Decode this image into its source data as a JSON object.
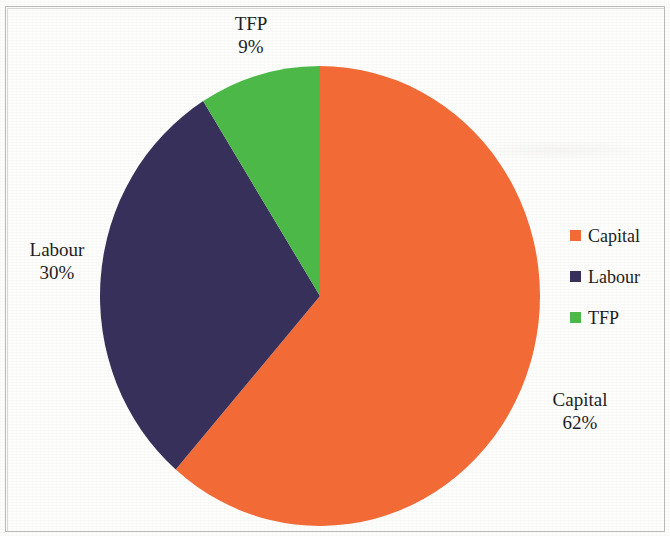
{
  "chart_data": {
    "type": "pie",
    "title": "",
    "subtitle": "",
    "xlabel": "",
    "ylabel": "",
    "grid": false,
    "legend_position": "right",
    "start_angle_deg": 0,
    "direction": "clockwise",
    "units": "percent",
    "total": 100,
    "categories": [
      "Capital",
      "Labour",
      "TFP"
    ],
    "values": [
      62,
      30,
      9
    ],
    "colors": [
      "#F26B36",
      "#37305A",
      "#4CB847"
    ],
    "slices": [
      {
        "label": "Capital",
        "value": 62,
        "value_text": "62%",
        "color": "#F26B36"
      },
      {
        "label": "Labour",
        "value": 30,
        "value_text": "30%",
        "color": "#37305A"
      },
      {
        "label": "TFP",
        "value": 9,
        "value_text": "9%",
        "color": "#4CB847"
      }
    ],
    "data_labels": [
      {
        "name": "TFP",
        "percent": "9%"
      },
      {
        "name": "Labour",
        "percent": "30%"
      },
      {
        "name": "Capital",
        "percent": "62%"
      }
    ]
  },
  "labels": {
    "tfp": {
      "name": "TFP",
      "percent": "9%"
    },
    "labour": {
      "name": "Labour",
      "percent": "30%"
    },
    "capital": {
      "name": "Capital",
      "percent": "62%"
    }
  },
  "legend": {
    "items": [
      {
        "label": "Capital",
        "color": "#F26B36"
      },
      {
        "label": "Labour",
        "color": "#37305A"
      },
      {
        "label": "TFP",
        "color": "#4CB847"
      }
    ]
  },
  "colors": {
    "capital": "#F26B36",
    "labour": "#37305A",
    "tfp": "#4CB847",
    "text": "#1d1d1d",
    "background": "#fdfdfc",
    "frame": "#b9b9b9"
  }
}
